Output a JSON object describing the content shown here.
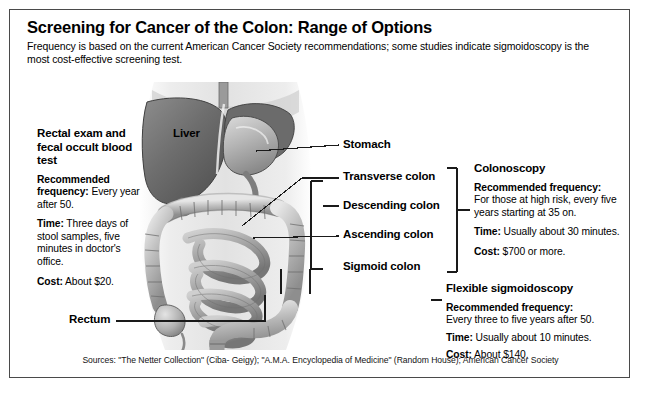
{
  "header": {
    "title": "Screening for Cancer of the Colon: Range of Options",
    "subtitle": "Frequency is based on the current American Cancer Society recommendations; some studies indicate sigmoidoscopy is the most cost-effective screening test."
  },
  "illustration": {
    "alt": "Grayscale anatomical illustration of the human abdomen showing the liver, stomach and large intestine",
    "liver_label": "Liver"
  },
  "anatomy_labels": [
    {
      "id": "stomach",
      "label": "Stomach"
    },
    {
      "id": "transverse",
      "label": "Transverse colon"
    },
    {
      "id": "descending",
      "label": "Descending colon"
    },
    {
      "id": "ascending",
      "label": "Ascending colon"
    },
    {
      "id": "sigmoid",
      "label": "Sigmoid colon"
    },
    {
      "id": "rectum",
      "label": "Rectum"
    }
  ],
  "panels": [
    {
      "id": "fobt",
      "heading": "Rectal exam and fecal occult blood test",
      "items": [
        {
          "term": "Recommended frequency:",
          "value": " Every year after 50."
        },
        {
          "term": "Time:",
          "value": " Three days of stool samples, five minutes in doctor's office."
        },
        {
          "term": "Cost:",
          "value": " About $20."
        }
      ]
    },
    {
      "id": "colonoscopy",
      "heading": "Colonoscopy",
      "items": [
        {
          "term": "Recommended frequency:",
          "value": " For those at high risk, every five years starting at 35 on."
        },
        {
          "term": "Time:",
          "value": " Usually about 30 minutes."
        },
        {
          "term": "Cost:",
          "value": " $700 or more."
        }
      ]
    },
    {
      "id": "sigmoidoscopy",
      "heading": "Flexible sigmoidoscopy",
      "items": [
        {
          "term": "Recommended frequency:",
          "value": " Every three to five years after 50."
        },
        {
          "term": "Time:",
          "value": " Usually about 10 minutes."
        },
        {
          "term": "Cost:",
          "value": " About $140."
        }
      ]
    }
  ],
  "footer": {
    "sources": "Sources: \"The Netter Collection\" (Ciba- Geigy); \"A.M.A. Encyclopedia of Medicine\" (Random House); American Cancer Society"
  },
  "colors": {
    "border": "#4a4a4a",
    "text": "#000000",
    "leader_line": "#1a1a1a",
    "background": "#ffffff"
  }
}
